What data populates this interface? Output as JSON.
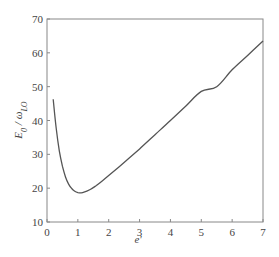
{
  "chart_data": {
    "type": "line",
    "title": "",
    "xlabel": "e'",
    "ylabel": "E0 / ωLO",
    "ylabel_parts": {
      "main": "E",
      "main_sub": "0",
      "sep": " / ",
      "den": "ω",
      "den_sub": "LO"
    },
    "xlim": [
      0,
      7
    ],
    "ylim": [
      10,
      70
    ],
    "xticks": [
      0,
      1,
      2,
      3,
      4,
      5,
      6,
      7
    ],
    "yticks": [
      10,
      20,
      30,
      40,
      50,
      60,
      70
    ],
    "grid": false,
    "legend": null,
    "series": [
      {
        "name": "E0/ωLO vs e'",
        "color": "#555555",
        "x": [
          0.2,
          0.3,
          0.4,
          0.5,
          0.6,
          0.7,
          0.8,
          0.9,
          1.0,
          1.1,
          1.2,
          1.4,
          1.6,
          1.8,
          2.0,
          2.5,
          3.0,
          3.5,
          4.0,
          4.5,
          5.0,
          5.5,
          6.0,
          6.5,
          7.0
        ],
        "values": [
          46.3,
          37.5,
          31.0,
          26.5,
          23.3,
          21.2,
          19.9,
          19.1,
          18.7,
          18.6,
          18.8,
          19.6,
          20.8,
          22.2,
          23.7,
          27.6,
          31.6,
          35.8,
          40.0,
          44.3,
          48.6,
          50.0,
          55.0,
          59.2,
          63.5
        ]
      }
    ]
  }
}
